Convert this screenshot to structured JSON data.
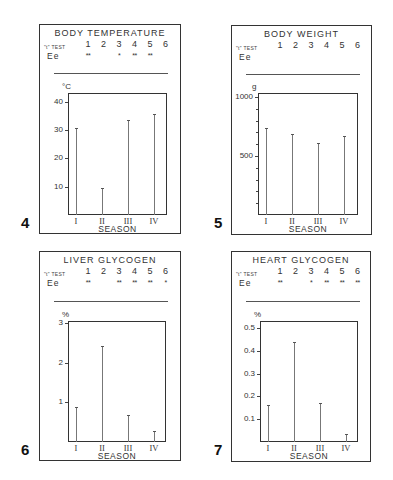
{
  "figures": [
    {
      "number": "4",
      "title": "BODY TEMPERATURE",
      "ttest_label": "\"t\" TEST",
      "row_label": "Ee",
      "test_numbers": [
        "1",
        "2",
        "3",
        "4",
        "5",
        "6"
      ],
      "significance": [
        "**",
        "",
        "*",
        "**",
        "**",
        ""
      ],
      "unit": "°C",
      "y_ticks": [
        {
          "value": 10,
          "label": "10"
        },
        {
          "value": 20,
          "label": "20"
        },
        {
          "value": 30,
          "label": "30"
        },
        {
          "value": 40,
          "label": "40"
        }
      ],
      "minor_ticks": [],
      "x_labels": [
        "I",
        "II",
        "III",
        "IV"
      ],
      "x_title": "SEASON"
    },
    {
      "number": "5",
      "title": "BODY WEIGHT",
      "ttest_label": "\"t\" TEST",
      "row_label": "Ee",
      "test_numbers": [
        "1",
        "2",
        "3",
        "4",
        "5",
        "6"
      ],
      "significance": [
        "",
        "",
        "",
        "",
        "",
        ""
      ],
      "unit": "g",
      "y_ticks": [
        {
          "value": 500,
          "label": "500"
        },
        {
          "value": 1000,
          "label": "1000"
        }
      ],
      "minor_ticks": [
        100,
        200,
        300,
        400,
        600,
        700,
        800,
        900
      ],
      "x_labels": [
        "I",
        "II",
        "III",
        "IV"
      ],
      "x_title": "SEASON"
    },
    {
      "number": "6",
      "title": "LIVER GLYCOGEN",
      "ttest_label": "\"t\" TEST",
      "row_label": "Ee",
      "test_numbers": [
        "1",
        "2",
        "3",
        "4",
        "5",
        "6"
      ],
      "significance": [
        "**",
        "",
        "**",
        "**",
        "**",
        "*"
      ],
      "unit": "%",
      "y_ticks": [
        {
          "value": 1,
          "label": "1"
        },
        {
          "value": 2,
          "label": "2"
        },
        {
          "value": 3,
          "label": "3"
        }
      ],
      "minor_ticks": [],
      "x_labels": [
        "I",
        "II",
        "III",
        "IV"
      ],
      "x_title": "SEASON"
    },
    {
      "number": "7",
      "title": "HEART GLYCOGEN",
      "ttest_label": "\"t\" TEST",
      "row_label": "Ee",
      "test_numbers": [
        "1",
        "2",
        "3",
        "4",
        "5",
        "6"
      ],
      "significance": [
        "**",
        "",
        "*",
        "**",
        "**",
        "**"
      ],
      "unit": "%",
      "y_ticks": [
        {
          "value": 0.1,
          "label": "0.1"
        },
        {
          "value": 0.2,
          "label": "0.2"
        },
        {
          "value": 0.3,
          "label": "0.3"
        },
        {
          "value": 0.4,
          "label": "0.4"
        },
        {
          "value": 0.5,
          "label": "0.5"
        }
      ],
      "minor_ticks": [],
      "x_labels": [
        "I",
        "II",
        "III",
        "IV"
      ],
      "x_title": "SEASON"
    }
  ],
  "chart_data": [
    {
      "type": "bar",
      "title": "BODY TEMPERATURE",
      "figure_number": "4",
      "categories": [
        "I",
        "II",
        "III",
        "IV"
      ],
      "values": [
        30.5,
        9.5,
        33.5,
        35.5
      ],
      "xlabel": "SEASON",
      "ylabel": "°C",
      "ylim": [
        0,
        43
      ],
      "yticks": [
        10,
        20,
        30,
        40
      ],
      "grid": false,
      "legend": null,
      "annotations": {
        "ttest": "\"t\" TEST",
        "row": "Ee",
        "comparisons": [
          "1",
          "2",
          "3",
          "4",
          "5",
          "6"
        ],
        "significance": [
          "**",
          "",
          "*",
          "**",
          "**",
          ""
        ]
      }
    },
    {
      "type": "bar",
      "title": "BODY WEIGHT",
      "figure_number": "5",
      "categories": [
        "I",
        "II",
        "III",
        "IV"
      ],
      "values": [
        740,
        690,
        610,
        670
      ],
      "xlabel": "SEASON",
      "ylabel": "g",
      "ylim": [
        0,
        1000
      ],
      "yticks": [
        500,
        1000
      ],
      "grid": false,
      "legend": null,
      "annotations": {
        "ttest": "\"t\" TEST",
        "row": "Ee",
        "comparisons": [
          "1",
          "2",
          "3",
          "4",
          "5",
          "6"
        ],
        "significance": [
          "",
          "",
          "",
          "",
          "",
          ""
        ]
      }
    },
    {
      "type": "bar",
      "title": "LIVER GLYCOGEN",
      "figure_number": "6",
      "categories": [
        "I",
        "II",
        "III",
        "IV"
      ],
      "values": [
        0.88,
        2.43,
        0.67,
        0.27
      ],
      "xlabel": "SEASON",
      "ylabel": "%",
      "ylim": [
        0,
        3
      ],
      "yticks": [
        1,
        2,
        3
      ],
      "grid": false,
      "legend": null,
      "annotations": {
        "ttest": "\"t\" TEST",
        "row": "Ee",
        "comparisons": [
          "1",
          "2",
          "3",
          "4",
          "5",
          "6"
        ],
        "significance": [
          "**",
          "",
          "**",
          "**",
          "**",
          "*"
        ]
      }
    },
    {
      "type": "bar",
      "title": "HEART GLYCOGEN",
      "figure_number": "7",
      "categories": [
        "I",
        "II",
        "III",
        "IV"
      ],
      "values": [
        0.16,
        0.44,
        0.17,
        0.035
      ],
      "xlabel": "SEASON",
      "ylabel": "%",
      "ylim": [
        0,
        0.53
      ],
      "yticks": [
        0.1,
        0.2,
        0.3,
        0.4,
        0.5
      ],
      "grid": false,
      "legend": null,
      "annotations": {
        "ttest": "\"t\" TEST",
        "row": "Ee",
        "comparisons": [
          "1",
          "2",
          "3",
          "4",
          "5",
          "6"
        ],
        "significance": [
          "**",
          "",
          "*",
          "**",
          "**",
          "**"
        ]
      }
    }
  ]
}
